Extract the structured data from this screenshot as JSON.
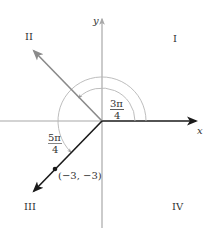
{
  "axes": {
    "x_label": "x",
    "y_label": "y"
  },
  "quadrants": {
    "I": "I",
    "II": "II",
    "III": "III",
    "IV": "IV"
  },
  "angles": [
    {
      "label_num": "3π",
      "label_den": "4",
      "radians": "3π/4",
      "terminal_quadrant": "II"
    },
    {
      "label_num": "5π",
      "label_den": "4",
      "radians": "5π/4",
      "terminal_quadrant": "III"
    }
  ],
  "point": {
    "label": "(−3, −3)",
    "x": -3,
    "y": -3
  },
  "colors": {
    "axis_gray": "#a8a8a8",
    "ray_gray": "#8a8a8a",
    "ray_black": "#1a1a1a",
    "arc_gray": "#b5b5b5",
    "text": "#333333"
  }
}
